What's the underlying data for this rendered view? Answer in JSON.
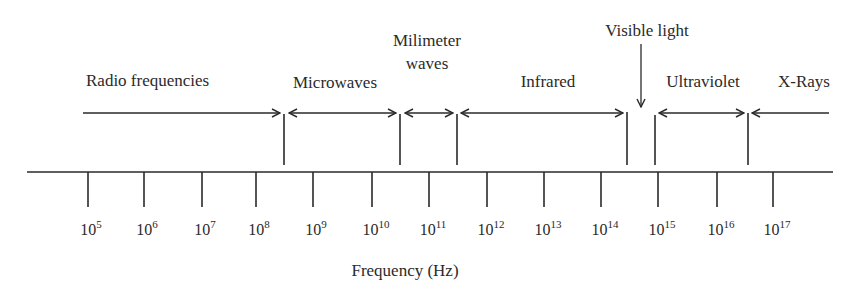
{
  "diagram": {
    "type": "electromagnetic-spectrum-frequency-axis",
    "axis_label": "Frequency (Hz)",
    "ticks": [
      {
        "base": "10",
        "exp": "5",
        "x": 88
      },
      {
        "base": "10",
        "exp": "6",
        "x": 144
      },
      {
        "base": "10",
        "exp": "7",
        "x": 202
      },
      {
        "base": "10",
        "exp": "8",
        "x": 256
      },
      {
        "base": "10",
        "exp": "9",
        "x": 313
      },
      {
        "base": "10",
        "exp": "10",
        "x": 372
      },
      {
        "base": "10",
        "exp": "11",
        "x": 429
      },
      {
        "base": "10",
        "exp": "12",
        "x": 487
      },
      {
        "base": "10",
        "exp": "13",
        "x": 544
      },
      {
        "base": "10",
        "exp": "14",
        "x": 601
      },
      {
        "base": "10",
        "exp": "15",
        "x": 658
      },
      {
        "base": "10",
        "exp": "16",
        "x": 717
      },
      {
        "base": "10",
        "exp": "17",
        "x": 773
      }
    ],
    "bands": [
      {
        "label": "Radio frequencies"
      },
      {
        "label": "Microwaves"
      },
      {
        "label_line1": "Milimeter",
        "label_line2": "waves"
      },
      {
        "label": "Infrared"
      },
      {
        "label": "Visible light"
      },
      {
        "label": "Ultraviolet"
      },
      {
        "label": "X-Rays"
      }
    ]
  },
  "colors": {
    "ink": "#2a2a2a",
    "background": "#ffffff"
  }
}
